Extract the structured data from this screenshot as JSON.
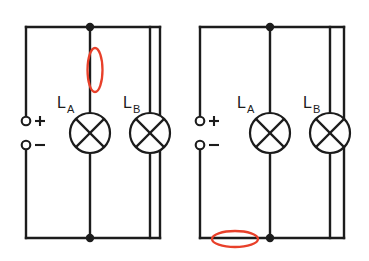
{
  "figure": {
    "background_color": "#ffffff",
    "wire_color": "#1c1c1c",
    "highlight_color": "#e8402a"
  },
  "circuits": [
    {
      "id": "left-circuit",
      "name": "left-circuit",
      "description": "Parallel circuit with highlight on vertical branch wire above lamp L_A",
      "supply": {
        "positive_label": "+",
        "negative_label": "−"
      },
      "lamps": [
        {
          "id": "left-lamp-a",
          "label_main": "L",
          "label_sub": "A",
          "symbol": "lamp-cross-circle"
        },
        {
          "id": "left-lamp-b",
          "label_main": "L",
          "label_sub": "B",
          "symbol": "lamp-cross-circle"
        }
      ],
      "highlight": {
        "id": "left-highlight",
        "orientation": "vertical",
        "target": "branch wire between top node and lamp L_A",
        "color": "#e8402a"
      },
      "nodes": [
        {
          "id": "left-top-node",
          "position": "top"
        },
        {
          "id": "left-bottom-node",
          "position": "bottom"
        }
      ]
    },
    {
      "id": "right-circuit",
      "name": "right-circuit",
      "description": "Parallel circuit with highlight on bottom main wire left of the bottom node",
      "supply": {
        "positive_label": "+",
        "negative_label": "−"
      },
      "lamps": [
        {
          "id": "right-lamp-a",
          "label_main": "L",
          "label_sub": "A",
          "symbol": "lamp-cross-circle"
        },
        {
          "id": "right-lamp-b",
          "label_main": "L",
          "label_sub": "B",
          "symbol": "lamp-cross-circle"
        }
      ],
      "highlight": {
        "id": "right-highlight",
        "orientation": "horizontal",
        "target": "bottom main wire between supply negative and bottom node",
        "color": "#e8402a"
      },
      "nodes": [
        {
          "id": "right-top-node",
          "position": "top"
        },
        {
          "id": "right-bottom-node",
          "position": "bottom"
        }
      ]
    }
  ]
}
